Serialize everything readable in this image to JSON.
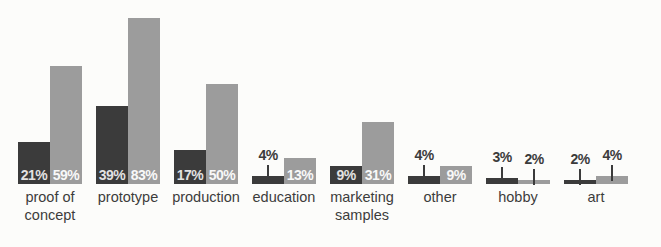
{
  "chart_data": {
    "type": "bar",
    "title": "",
    "xlabel": "",
    "ylabel": "",
    "ylim": [
      0,
      100
    ],
    "grid": false,
    "legend": "none",
    "value_suffix": "%",
    "categories": [
      "proof of concept",
      "prototype",
      "production",
      "education",
      "marketing samples",
      "other",
      "hobby",
      "art"
    ],
    "series": [
      {
        "name": "dark-series",
        "color": "#3b3b3b",
        "values": [
          21,
          39,
          17,
          4,
          9,
          4,
          3,
          2
        ]
      },
      {
        "name": "light-series",
        "color": "#9c9c9c",
        "values": [
          59,
          83,
          50,
          13,
          31,
          9,
          2,
          4
        ]
      }
    ],
    "label_placement_threshold": 9,
    "inside_label_colors": {
      "dark-series": "#e2e2e2",
      "light-series": "#f8f8f8"
    },
    "callout_label_color": "#3b3b3b",
    "callout_line_color": "#3b3b3b",
    "category_label_color": "#3c3c3c",
    "background_color": "#fcfcfa"
  }
}
